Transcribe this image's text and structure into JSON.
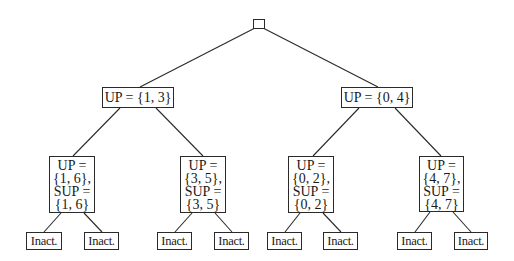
{
  "tree": {
    "root": {
      "label": ""
    },
    "level1": [
      {
        "label": "UP = {1, 3}"
      },
      {
        "label": "UP = {0, 4}"
      }
    ],
    "level2": [
      {
        "lines": [
          "UP =",
          "{1, 6},",
          "SUP =",
          "{1, 6}"
        ]
      },
      {
        "lines": [
          "UP =",
          "{3, 5},",
          "SUP =",
          "{3, 5}"
        ]
      },
      {
        "lines": [
          "UP =",
          "{0, 2},",
          "SUP =",
          "{0, 2}"
        ]
      },
      {
        "lines": [
          "UP =",
          "{4, 7},",
          "SUP =",
          "{4, 7}"
        ]
      }
    ],
    "leaves": [
      {
        "label": "Inact."
      },
      {
        "label": "Inact."
      },
      {
        "label": "Inact."
      },
      {
        "label": "Inact."
      },
      {
        "label": "Inact."
      },
      {
        "label": "Inact."
      },
      {
        "label": "Inact."
      },
      {
        "label": "Inact."
      }
    ]
  },
  "colors": {
    "line": "#2a2a2a",
    "background": "#ffffff"
  }
}
